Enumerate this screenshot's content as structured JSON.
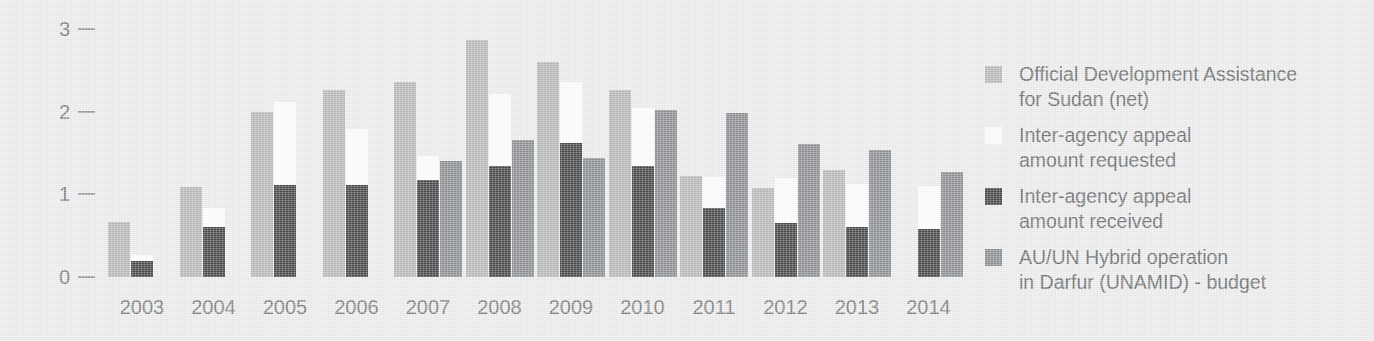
{
  "colors": {
    "background": "#ecedec",
    "oda": "#b7b8b8",
    "requested": "#fdfdfd",
    "received": "#46484a",
    "unamid": "#8d9093",
    "text": "#6d7073",
    "tick": "#9a9d9f"
  },
  "axis": {
    "y_ticks": [
      "3",
      "2",
      "1",
      "0"
    ],
    "y_values": [
      3,
      2,
      1,
      0
    ],
    "ymin": 0,
    "ymax": 3
  },
  "legend": {
    "items": [
      {
        "swatch_name": "legend-swatch-oda",
        "color_key": "oda",
        "label": "Official Development Assistance\nfor Sudan (net)"
      },
      {
        "swatch_name": "legend-swatch-requested",
        "color_key": "requested",
        "label": "Inter-agency appeal\namount requested"
      },
      {
        "swatch_name": "legend-swatch-received",
        "color_key": "received",
        "label": "Inter-agency appeal\namount received"
      },
      {
        "swatch_name": "legend-swatch-unamid",
        "color_key": "unamid",
        "label": "AU/UN Hybrid operation\nin Darfur (UNAMID) - budget"
      }
    ]
  },
  "chart_data": {
    "type": "bar",
    "title": "",
    "xlabel": "",
    "ylabel": "",
    "ylim": [
      0,
      3
    ],
    "grid": false,
    "legend_position": "right",
    "categories": [
      "2003",
      "2004",
      "2005",
      "2006",
      "2007",
      "2008",
      "2009",
      "2010",
      "2011",
      "2012",
      "2013",
      "2014"
    ],
    "series": [
      {
        "name": "Official Development Assistance for Sudan (net)",
        "key": "oda",
        "color": "#b7b8b8",
        "values": [
          0.67,
          1.09,
          2.0,
          2.27,
          2.36,
          2.87,
          2.6,
          2.27,
          1.22,
          1.08,
          1.29,
          null
        ]
      },
      {
        "name": "Inter-agency appeal amount requested",
        "key": "requested",
        "color": "#fdfdfd",
        "values": [
          0.27,
          0.84,
          2.12,
          1.79,
          1.46,
          2.22,
          2.36,
          2.05,
          1.21,
          1.2,
          1.13,
          1.1
        ]
      },
      {
        "name": "Inter-agency appeal amount received",
        "key": "received",
        "color": "#46484a",
        "values": [
          0.19,
          0.6,
          1.12,
          1.12,
          1.18,
          1.34,
          1.62,
          1.34,
          0.83,
          0.65,
          0.61,
          0.58
        ]
      },
      {
        "name": "AU/UN Hybrid operation in Darfur (UNAMID) - budget",
        "key": "unamid",
        "color": "#8d9093",
        "values": [
          null,
          null,
          null,
          null,
          1.41,
          1.66,
          1.44,
          2.02,
          1.99,
          1.61,
          1.54,
          1.27
        ]
      }
    ]
  }
}
